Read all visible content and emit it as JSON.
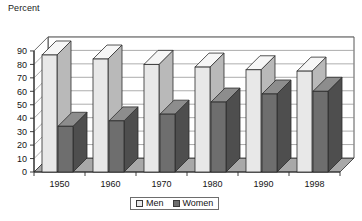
{
  "chart_data": {
    "type": "bar",
    "title": "",
    "ylabel": "Percent",
    "xlabel": "",
    "ylim": [
      0,
      90
    ],
    "ytick_step": 10,
    "yticks": [
      "0",
      "10",
      "20",
      "30",
      "40",
      "50",
      "60",
      "70",
      "80",
      "90"
    ],
    "grid": true,
    "three_d": true,
    "legend_position": "bottom-center",
    "categories": [
      "1950",
      "1960",
      "1970",
      "1980",
      "1990",
      "1998"
    ],
    "series": [
      {
        "name": "Men",
        "values": [
          87,
          84,
          80,
          78,
          76,
          75
        ],
        "color": "#e8e8e8"
      },
      {
        "name": "Women",
        "values": [
          34,
          38,
          43,
          52,
          58,
          60
        ],
        "color": "#6e6e6e"
      }
    ]
  },
  "legend": {
    "men_label": "Men",
    "women_label": "Women"
  },
  "colors": {
    "men_face": "#e8e8e8",
    "men_top": "#f6f6f6",
    "men_side": "#b9b9b9",
    "women_face": "#6e6e6e",
    "women_top": "#8d8d8d",
    "women_side": "#4e4e4e",
    "floor": "#a8a8a8",
    "back_wall": "#ffffff",
    "grid_line": "#8a8a8a",
    "outline": "#2b2b2b"
  }
}
